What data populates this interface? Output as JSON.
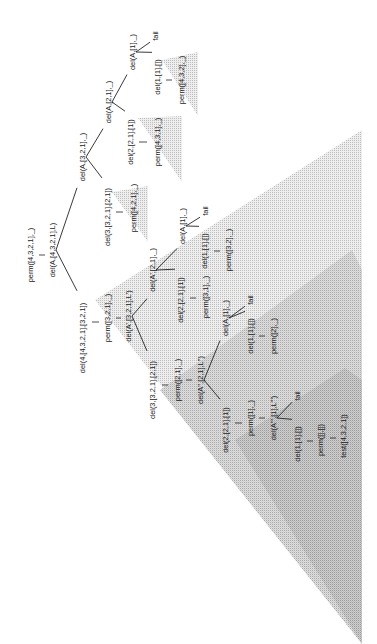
{
  "diagram": {
    "title": "",
    "orientation": "rotated-90-ccw",
    "colors": {
      "line": "#222222",
      "text": "#1a1a1a",
      "shade_light": "#e3e3e3",
      "shade_mid": "#d2d2d2",
      "shade_dark": "#c4c4c4"
    },
    "nodes": [
      {
        "id": "n1",
        "label": "perm([4,3,2,1],_)",
        "x": 30,
        "y": 255
      },
      {
        "id": "n2",
        "label": "del(A,[4,3,2,1],L)",
        "x": 52,
        "y": 250
      },
      {
        "id": "n3",
        "label": "del(A,[3,2,1],_)",
        "x": 82,
        "y": 157
      },
      {
        "id": "n4",
        "label": "del(3,[3,2,1],[2,1])",
        "x": 107,
        "y": 217
      },
      {
        "id": "n5",
        "label": "perm([4,2,1],_)",
        "x": 133,
        "y": 208
      },
      {
        "id": "n6",
        "label": "del(A,[2,1],_)",
        "x": 108,
        "y": 102
      },
      {
        "id": "n7",
        "label": "del(2,[2,1],[1])",
        "x": 130,
        "y": 142
      },
      {
        "id": "n8",
        "label": "perm([4,3,1],_)",
        "x": 157,
        "y": 142
      },
      {
        "id": "n9",
        "label": "del(A,[1],_)",
        "x": 132,
        "y": 52
      },
      {
        "id": "n10",
        "label": "fail",
        "x": 155,
        "y": 36
      },
      {
        "id": "n11",
        "label": "del(1,[1],[])",
        "x": 157,
        "y": 77
      },
      {
        "id": "n12",
        "label": "perm([4,3,2],_)",
        "x": 181,
        "y": 80
      },
      {
        "id": "n13",
        "label": "del(4,[4,3,2,1],[3,2,1])",
        "x": 82,
        "y": 338
      },
      {
        "id": "n14",
        "label": "perm([3,2,1],_)",
        "x": 107,
        "y": 318
      },
      {
        "id": "n15",
        "label": "del(A',[3,2,1],L')",
        "x": 128,
        "y": 316
      },
      {
        "id": "n16",
        "label": "del(A',[2,1],_)",
        "x": 152,
        "y": 270
      },
      {
        "id": "n17",
        "label": "del(2,[2,1],[1])",
        "x": 180,
        "y": 300
      },
      {
        "id": "n18",
        "label": "perm([3,1],_)",
        "x": 205,
        "y": 297
      },
      {
        "id": "n19",
        "label": "del(A,[1],_)",
        "x": 182,
        "y": 226
      },
      {
        "id": "n20",
        "label": "fail",
        "x": 205,
        "y": 211
      },
      {
        "id": "n21",
        "label": "del(1,[1],[])",
        "x": 204,
        "y": 251
      },
      {
        "id": "n22",
        "label": "perm([3,2],_)",
        "x": 228,
        "y": 250
      },
      {
        "id": "n23",
        "label": "del(3,[3,2,1],[2,1])",
        "x": 152,
        "y": 390
      },
      {
        "id": "n24",
        "label": "perm([2,1],_)",
        "x": 177,
        "y": 380
      },
      {
        "id": "n25",
        "label": "del(A'',[2,1],L'')",
        "x": 200,
        "y": 380
      },
      {
        "id": "n26",
        "label": "del(A,[1],_)",
        "x": 225,
        "y": 318
      },
      {
        "id": "n27",
        "label": "fail",
        "x": 250,
        "y": 300
      },
      {
        "id": "n28",
        "label": "del(1,[1],[])",
        "x": 250,
        "y": 336
      },
      {
        "id": "n29",
        "label": "perm([2],_)",
        "x": 273,
        "y": 336
      },
      {
        "id": "n30",
        "label": "del(2,[2,1],[1])",
        "x": 225,
        "y": 430
      },
      {
        "id": "n31",
        "label": "perm([1],_)",
        "x": 250,
        "y": 418
      },
      {
        "id": "n32",
        "label": "del(A''',[1],L''')",
        "x": 273,
        "y": 418
      },
      {
        "id": "n33",
        "label": "fail",
        "x": 297,
        "y": 396
      },
      {
        "id": "n34",
        "label": "del(1,[1],[])",
        "x": 297,
        "y": 444
      },
      {
        "id": "n35",
        "label": "perm([],[])",
        "x": 320,
        "y": 440
      },
      {
        "id": "n36",
        "label": "test([4,3,2,1])",
        "x": 343,
        "y": 436
      }
    ],
    "edges": [
      {
        "from": "n2",
        "to": "n3",
        "type": "branch"
      },
      {
        "from": "n2",
        "to": "n13",
        "type": "branch"
      },
      {
        "from": "n3",
        "to": "n6",
        "type": "branch"
      },
      {
        "from": "n3",
        "to": "n4",
        "type": "branch"
      },
      {
        "from": "n6",
        "to": "n9",
        "type": "branch"
      },
      {
        "from": "n6",
        "to": "n7",
        "type": "branch"
      },
      {
        "from": "n9",
        "to": "n10",
        "type": "branch"
      },
      {
        "from": "n9",
        "to": "n11",
        "type": "branch"
      },
      {
        "from": "n15",
        "to": "n16",
        "type": "branch"
      },
      {
        "from": "n15",
        "to": "n23",
        "type": "branch"
      },
      {
        "from": "n16",
        "to": "n19",
        "type": "branch"
      },
      {
        "from": "n16",
        "to": "n17",
        "type": "branch"
      },
      {
        "from": "n19",
        "to": "n20",
        "type": "branch"
      },
      {
        "from": "n19",
        "to": "n21",
        "type": "branch"
      },
      {
        "from": "n25",
        "to": "n26",
        "type": "branch"
      },
      {
        "from": "n25",
        "to": "n30",
        "type": "branch"
      },
      {
        "from": "n26",
        "to": "n27",
        "type": "branch"
      },
      {
        "from": "n26",
        "to": "n28",
        "type": "branch"
      },
      {
        "from": "n32",
        "to": "n33",
        "type": "branch"
      },
      {
        "from": "n32",
        "to": "n34",
        "type": "branch"
      }
    ],
    "ticks": [
      {
        "x1": 39,
        "y1": 255,
        "x2": 45,
        "y2": 255
      },
      {
        "x1": 116,
        "y1": 212,
        "x2": 123,
        "y2": 212
      },
      {
        "x1": 139,
        "y1": 142,
        "x2": 147,
        "y2": 142
      },
      {
        "x1": 166,
        "y1": 80,
        "x2": 172,
        "y2": 80
      },
      {
        "x1": 92,
        "y1": 322,
        "x2": 99,
        "y2": 322
      },
      {
        "x1": 116,
        "y1": 318,
        "x2": 121,
        "y2": 318
      },
      {
        "x1": 190,
        "y1": 298,
        "x2": 196,
        "y2": 298
      },
      {
        "x1": 214,
        "y1": 251,
        "x2": 220,
        "y2": 251
      },
      {
        "x1": 162,
        "y1": 385,
        "x2": 168,
        "y2": 385
      },
      {
        "x1": 186,
        "y1": 380,
        "x2": 192,
        "y2": 380
      },
      {
        "x1": 259,
        "y1": 336,
        "x2": 265,
        "y2": 336
      },
      {
        "x1": 235,
        "y1": 423,
        "x2": 242,
        "y2": 423
      },
      {
        "x1": 259,
        "y1": 418,
        "x2": 265,
        "y2": 418
      },
      {
        "x1": 307,
        "y1": 441,
        "x2": 313,
        "y2": 441
      },
      {
        "x1": 330,
        "y1": 438,
        "x2": 336,
        "y2": 438
      }
    ],
    "triangles": [
      {
        "name": "subtree-perm-4-3-2",
        "points": "162,60 198,52 198,116",
        "shade": "light"
      },
      {
        "name": "subtree-perm-4-3-1",
        "points": "138,118 182,116 182,182",
        "shade": "light"
      },
      {
        "name": "subtree-perm-4-2-1",
        "points": "112,192 148,186 148,242",
        "shade": "light"
      },
      {
        "name": "subtree-perm-3-2-1",
        "points": "95,300 362,130 362,644",
        "shade": "light"
      },
      {
        "name": "subtree-perm-2-1",
        "points": "160,390 352,250 362,270 362,644",
        "shade": "mid"
      },
      {
        "name": "subtree-perm-1",
        "points": "235,440 345,368 362,380 362,644",
        "shade": "dark"
      }
    ]
  }
}
